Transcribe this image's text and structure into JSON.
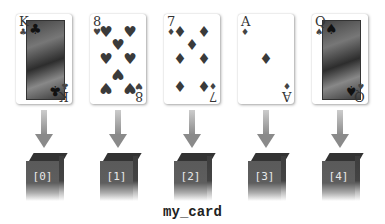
{
  "diagram": {
    "title_label": "my_card",
    "elements": [
      {
        "index_label": "[0]",
        "card": {
          "rank": "K",
          "suit": "♣",
          "name": "King of Clubs"
        }
      },
      {
        "index_label": "[1]",
        "card": {
          "rank": "8",
          "suit": "♥",
          "name": "Eight of Hearts"
        }
      },
      {
        "index_label": "[2]",
        "card": {
          "rank": "7",
          "suit": "♦",
          "name": "Seven of Diamonds"
        }
      },
      {
        "index_label": "[3]",
        "card": {
          "rank": "A",
          "suit": "♦",
          "name": "Ace of Diamonds"
        }
      },
      {
        "index_label": "[4]",
        "card": {
          "rank": "Q",
          "suit": "♠",
          "name": "Queen of Spades"
        }
      }
    ]
  }
}
